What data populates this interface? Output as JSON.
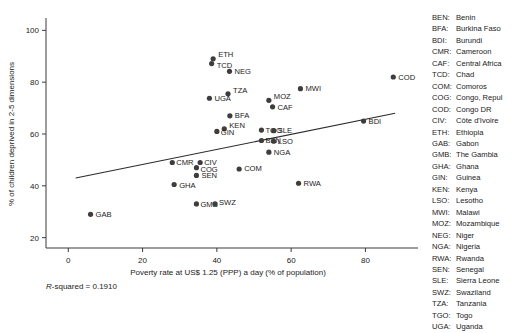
{
  "chart_data": {
    "type": "scatter",
    "title": "",
    "xlabel": "Poverty rate at US$ 1.25 (PPP) a day (% of population)",
    "ylabel": "% of children deprived in 2-5 dimensions",
    "xlim": [
      -6,
      92
    ],
    "ylim": [
      16,
      104
    ],
    "xticks": [
      0,
      20,
      40,
      60,
      80
    ],
    "yticks": [
      20,
      40,
      60,
      80,
      100
    ],
    "grid": false,
    "annotation": "R-squared = 0.1910",
    "annotation_stat_label": "R",
    "annotation_rest": "-squared = 0.1910",
    "trendline": {
      "x0": 2.0,
      "y0": 43.0,
      "x1": 88.0,
      "y1": 68.0
    },
    "points": [
      {
        "code": "ETH",
        "x": 39.0,
        "y": 89.0,
        "label_dx": 5,
        "label_dy": -2
      },
      {
        "code": "TCD",
        "x": 38.6,
        "y": 87.2,
        "label_dx": 5,
        "label_dy": 4
      },
      {
        "code": "NEG",
        "x": 43.4,
        "y": 84.2,
        "label_dx": 5,
        "label_dy": 2.5
      },
      {
        "code": "TZA",
        "x": 43.0,
        "y": 75.5,
        "label_dx": 5,
        "label_dy": -1
      },
      {
        "code": "UGA",
        "x": 38.0,
        "y": 73.8,
        "label_dx": 5,
        "label_dy": 3
      },
      {
        "code": "MWI",
        "x": 62.5,
        "y": 77.5,
        "label_dx": 5,
        "label_dy": 2.5
      },
      {
        "code": "COD",
        "x": 87.5,
        "y": 82.0,
        "label_dx": 5,
        "label_dy": 2.5
      },
      {
        "code": "MOZ",
        "x": 54.0,
        "y": 73.0,
        "label_dx": 5,
        "label_dy": -1
      },
      {
        "code": "CAF",
        "x": 55.0,
        "y": 70.5,
        "label_dx": 5,
        "label_dy": 3
      },
      {
        "code": "BFA",
        "x": 43.5,
        "y": 67.0,
        "label_dx": 5,
        "label_dy": 2.5
      },
      {
        "code": "BDI",
        "x": 79.5,
        "y": 65.0,
        "label_dx": 5,
        "label_dy": 2.5
      },
      {
        "code": "KEN",
        "x": 42.0,
        "y": 62.0,
        "label_dx": 5,
        "label_dy": -0.5
      },
      {
        "code": "GIN",
        "x": 40.0,
        "y": 61.0,
        "label_dx": 4,
        "label_dy": 4
      },
      {
        "code": "TGO",
        "x": 52.0,
        "y": 61.5,
        "label_dx": 4,
        "label_dy": 2.5
      },
      {
        "code": "SLE",
        "x": 55.3,
        "y": 61.3,
        "label_dx": 4,
        "label_dy": 2.5
      },
      {
        "code": "BEN",
        "x": 52.0,
        "y": 57.5,
        "label_dx": 4,
        "label_dy": 2.5
      },
      {
        "code": "LSO",
        "x": 55.3,
        "y": 57.2,
        "label_dx": 4,
        "label_dy": 2.5
      },
      {
        "code": "NGA",
        "x": 54.0,
        "y": 53.0,
        "label_dx": 5,
        "label_dy": 2.5
      },
      {
        "code": "CMR",
        "x": 28.0,
        "y": 49.0,
        "label_dx": 4,
        "label_dy": 2.5
      },
      {
        "code": "CIV",
        "x": 35.5,
        "y": 49.0,
        "label_dx": 4,
        "label_dy": 2
      },
      {
        "code": "COG",
        "x": 34.5,
        "y": 47.0,
        "label_dx": 4,
        "label_dy": 4
      },
      {
        "code": "COM",
        "x": 46.0,
        "y": 46.5,
        "label_dx": 5,
        "label_dy": 2.5
      },
      {
        "code": "SEN",
        "x": 34.5,
        "y": 44.0,
        "label_dx": 5,
        "label_dy": 2.5
      },
      {
        "code": "GHA",
        "x": 28.5,
        "y": 40.5,
        "label_dx": 5,
        "label_dy": 3
      },
      {
        "code": "RWA",
        "x": 62.0,
        "y": 41.0,
        "label_dx": 5,
        "label_dy": 2.5
      },
      {
        "code": "GMB",
        "x": 34.5,
        "y": 33.0,
        "label_dx": 4,
        "label_dy": 3
      },
      {
        "code": "SWZ",
        "x": 39.5,
        "y": 33.0,
        "label_dx": 4,
        "label_dy": 1.5
      },
      {
        "code": "GAB",
        "x": 6.0,
        "y": 29.0,
        "label_dx": 5,
        "label_dy": 3
      }
    ]
  },
  "legend": {
    "entries": [
      {
        "code": "BEN:",
        "name": "Benin"
      },
      {
        "code": "BFA:",
        "name": "Burkina Faso"
      },
      {
        "code": "BDI:",
        "name": "Burundi"
      },
      {
        "code": "CMR:",
        "name": "Cameroon"
      },
      {
        "code": "CAF:",
        "name": "Central Africa"
      },
      {
        "code": "TCD:",
        "name": "Chad"
      },
      {
        "code": "COM:",
        "name": "Comoros"
      },
      {
        "code": "COG:",
        "name": "Congo, Repul"
      },
      {
        "code": "COD:",
        "name": "Congo DR"
      },
      {
        "code": "CIV:",
        "name": "Côte d'Ivoire"
      },
      {
        "code": "ETH:",
        "name": "Ethiopia"
      },
      {
        "code": "GAB:",
        "name": "Gabon"
      },
      {
        "code": "GMB:",
        "name": "The Gambia"
      },
      {
        "code": "GHA:",
        "name": "Ghana"
      },
      {
        "code": "GIN:",
        "name": "Guinea"
      },
      {
        "code": "KEN:",
        "name": "Kenya"
      },
      {
        "code": "LSO:",
        "name": "Lesotho"
      },
      {
        "code": "MWI:",
        "name": "Malawi"
      },
      {
        "code": "MOZ:",
        "name": "Mozambique"
      },
      {
        "code": "NEG:",
        "name": "Niger"
      },
      {
        "code": "NGA:",
        "name": "Nigeria"
      },
      {
        "code": "RWA:",
        "name": "Rwanda"
      },
      {
        "code": "SEN:",
        "name": "Senegal"
      },
      {
        "code": "SLE:",
        "name": "Sierra Leone"
      },
      {
        "code": "SWZ:",
        "name": "Swaziland"
      },
      {
        "code": "TZA:",
        "name": "Tanzania"
      },
      {
        "code": "TGO:",
        "name": "Togo"
      },
      {
        "code": "UGA:",
        "name": "Uganda"
      }
    ]
  }
}
